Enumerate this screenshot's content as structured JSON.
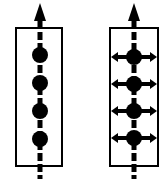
{
  "figure": {
    "title": "Two schematic diagrams of beads on a vertical dashed axis",
    "background_color": "#ffffff",
    "stroke_color": "#000000",
    "width": 166,
    "height": 184,
    "panels": [
      {
        "id": "panel-left",
        "name": "left-diagram",
        "label": "",
        "box": {
          "x": 16,
          "y": 28,
          "width": 46,
          "height": 138
        },
        "box_stroke_width": 2,
        "axis": {
          "name": "vertical-dashed-arrow",
          "x": 40,
          "y_top": 3,
          "y_bottom": 179,
          "line_width": 5,
          "dash_pattern": "8 3",
          "arrow_head": {
            "direction": "up",
            "tip_y": 3,
            "base_y": 21,
            "half_width": 6
          }
        },
        "nodes": [
          {
            "name": "bead-1",
            "cx": 40,
            "cy": 55,
            "r": 8,
            "fill": "#000000",
            "arms": false
          },
          {
            "name": "bead-2",
            "cx": 40,
            "cy": 83,
            "r": 8,
            "fill": "#000000",
            "arms": false
          },
          {
            "name": "bead-3",
            "cx": 40,
            "cy": 111,
            "r": 8,
            "fill": "#000000",
            "arms": false
          },
          {
            "name": "bead-4",
            "cx": 40,
            "cy": 139,
            "r": 8,
            "fill": "#000000",
            "arms": false
          }
        ]
      },
      {
        "id": "panel-right",
        "name": "right-diagram",
        "label": "",
        "box": {
          "x": 110,
          "y": 28,
          "width": 48,
          "height": 138
        },
        "box_stroke_width": 2,
        "axis": {
          "name": "vertical-dashed-arrow",
          "x": 134,
          "y_top": 3,
          "y_bottom": 179,
          "line_width": 5,
          "dash_pattern": "8 3",
          "arrow_head": {
            "direction": "up",
            "tip_y": 3,
            "base_y": 21,
            "half_width": 6
          }
        },
        "nodes": [
          {
            "name": "bead-1",
            "cx": 134,
            "cy": 57,
            "r": 8,
            "fill": "#000000",
            "arms": true
          },
          {
            "name": "bead-2",
            "cx": 134,
            "cy": 84,
            "r": 8,
            "fill": "#000000",
            "arms": true
          },
          {
            "name": "bead-3",
            "cx": 134,
            "cy": 111,
            "r": 8,
            "fill": "#000000",
            "arms": true
          },
          {
            "name": "bead-4",
            "cx": 134,
            "cy": 138,
            "r": 8,
            "fill": "#000000",
            "arms": true
          }
        ],
        "arm": {
          "name": "horizontal-double-arrow",
          "half_length": 23,
          "line_width": 4,
          "arrow_half_width": 5,
          "arrow_length": 7
        }
      }
    ]
  }
}
